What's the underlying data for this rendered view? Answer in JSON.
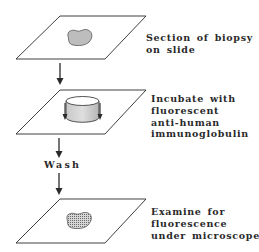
{
  "diagram": {
    "steps": [
      {
        "id": "section",
        "label_lines": [
          "Section of biopsy",
          "on slide"
        ],
        "illustration": "slide-with-tissue-section"
      },
      {
        "id": "incubate",
        "label_lines": [
          "Incubate with",
          "fluorescent",
          "anti-human",
          "immunoglobulin"
        ],
        "illustration": "slide-with-reagent-well"
      },
      {
        "id": "examine",
        "label_lines": [
          "Examine for",
          "fluorescence",
          "under microscope"
        ],
        "illustration": "slide-with-stained-section"
      }
    ],
    "connectors": [
      {
        "from": "section",
        "to": "incubate",
        "label": ""
      },
      {
        "from": "incubate",
        "to": "examine",
        "label": "Wash"
      }
    ],
    "colors": {
      "line": "#2a2a2a",
      "tissue_fill": "#bdbdbd",
      "stained_fill": "#8c8c8c",
      "background": "#ffffff"
    }
  }
}
